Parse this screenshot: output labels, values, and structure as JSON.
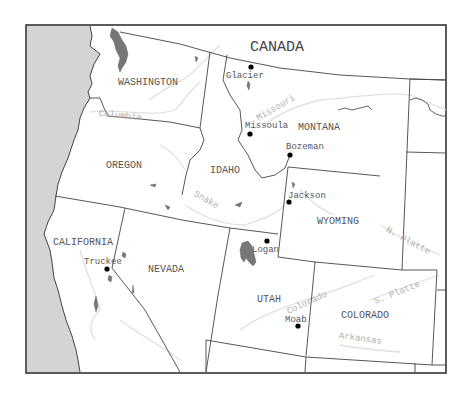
{
  "map": {
    "country_label": "CANADA",
    "states": [
      {
        "name": "WASHINGTON",
        "x": 118,
        "y": 85
      },
      {
        "name": "OREGON",
        "x": 106,
        "y": 168
      },
      {
        "name": "IDAHO",
        "x": 210,
        "y": 173
      },
      {
        "name": "MONTANA",
        "x": 298,
        "y": 130
      },
      {
        "name": "WYOMING",
        "x": 317,
        "y": 224
      },
      {
        "name": "CALIFORNIA",
        "x": 53,
        "y": 245
      },
      {
        "name": "NEVADA",
        "x": 148,
        "y": 272
      },
      {
        "name": "UTAH",
        "x": 257,
        "y": 302
      },
      {
        "name": "COLORADO",
        "x": 341,
        "y": 318
      }
    ],
    "cities": [
      {
        "name": "Glacier",
        "dot_x": 251,
        "dot_y": 67,
        "label_x": 226,
        "label_y": 78
      },
      {
        "name": "Missoula",
        "dot_x": 250,
        "dot_y": 134,
        "label_x": 245,
        "label_y": 128
      },
      {
        "name": "Bozeman",
        "dot_x": 290,
        "dot_y": 155,
        "label_x": 286,
        "label_y": 149
      },
      {
        "name": "Jackson",
        "dot_x": 289,
        "dot_y": 202,
        "label_x": 288,
        "label_y": 198
      },
      {
        "name": "Logan",
        "dot_x": 267,
        "dot_y": 241,
        "label_x": 252,
        "label_y": 252
      },
      {
        "name": "Truckee",
        "dot_x": 107,
        "dot_y": 269,
        "label_x": 84,
        "label_y": 264
      },
      {
        "name": "Moab",
        "dot_x": 298,
        "dot_y": 326,
        "label_x": 285,
        "label_y": 322
      }
    ],
    "rivers": [
      {
        "name": "Columbia",
        "x": 120,
        "y": 118,
        "rotate": 5
      },
      {
        "name": "Missouri",
        "x": 277,
        "y": 110,
        "rotate": -30
      },
      {
        "name": "Snake",
        "x": 205,
        "y": 202,
        "rotate": 30
      },
      {
        "name": "Colorado",
        "x": 308,
        "y": 305,
        "rotate": -25
      },
      {
        "name": "N. Platte",
        "x": 407,
        "y": 243,
        "rotate": 28
      },
      {
        "name": "S. Platte",
        "x": 398,
        "y": 295,
        "rotate": -22
      },
      {
        "name": "Arkansas",
        "x": 360,
        "y": 341,
        "rotate": 8
      }
    ]
  }
}
